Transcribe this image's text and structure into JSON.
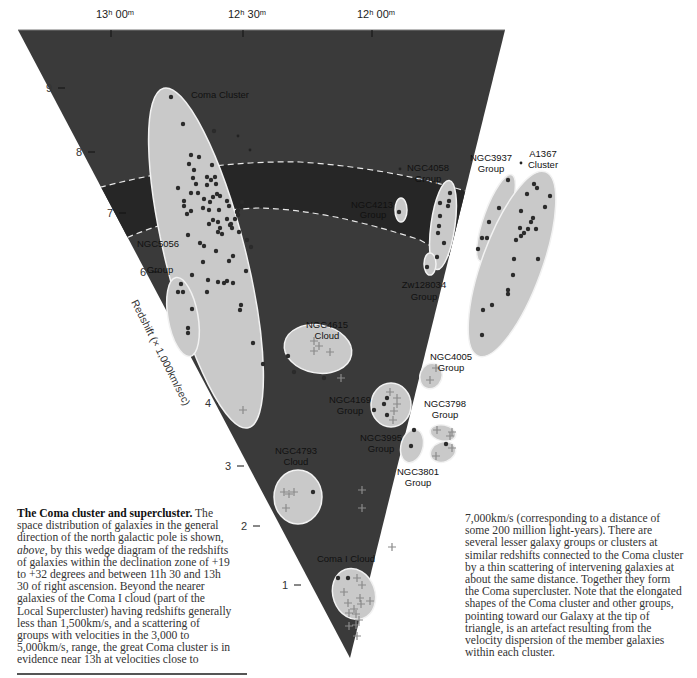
{
  "axes": {
    "top_ticks": [
      {
        "label": "13ʰ 00ᵐ",
        "x": 112
      },
      {
        "label": "12ʰ 30ᵐ",
        "x": 243
      },
      {
        "label": "12ʰ 00ᵐ",
        "x": 373
      }
    ],
    "redshift_ticks": [
      "1",
      "2",
      "3",
      "4",
      "5",
      "6",
      "7",
      "8",
      "9"
    ],
    "redshift_title": "Redshift (× 1,000km/sec)"
  },
  "groups": {
    "coma_cluster": "Coma Cluster",
    "ngc5056": [
      "NGC5056",
      "Group"
    ],
    "ngc4213": [
      "NGC4213",
      "Group"
    ],
    "ngc4058": [
      "NGC4058",
      "Group"
    ],
    "ngc3937": [
      "NGC3937",
      "Group"
    ],
    "a1367": [
      "A1367",
      "Cluster"
    ],
    "zw128034": [
      "Zw128034",
      "Group"
    ],
    "ngc4615": [
      "NGC4615",
      "Cloud"
    ],
    "ngc4005": [
      "NGC4005",
      "Group"
    ],
    "ngc4169": [
      "NGC4169",
      "Group"
    ],
    "ngc3798": [
      "NGC3798",
      "Group"
    ],
    "ngc3995": [
      "NGC3995",
      "Group"
    ],
    "ngc3801": [
      "NGC3801",
      "Group"
    ],
    "ngc4793": [
      "NGC4793",
      "Cloud"
    ],
    "coma_i_cloud": "Coma I Cloud"
  },
  "colors": {
    "wedge": "#3a3a3a",
    "band": "#262626",
    "ellipse_fill": "#c9c9c9",
    "ellipse_stroke": "#f2f2f2",
    "dot": "#2b2b2b",
    "cross": "#8a8a8a",
    "dash": "#e8e8e8"
  },
  "caption": {
    "left_title": "The Coma cluster and supercluster.",
    "left_text_1": " The space distribution of galaxies in the general direction of the north galactic pole is shown, ",
    "left_italic": "above",
    "left_text_2": ", by this wedge diagram of the redshifts of galaxies within the declination zone of +19 to +32 degrees and between 11h 30 and 13h 30 of right ascension. Beyond the nearer galaxies of the Coma I cloud (part of the Local Supercluster) having redshifts generally less than 1,500km/s, and a scattering of groups with velocities in the 3,000 to 5,000km/s, range, the great Coma cluster is in evidence near 13h at velocities close to",
    "right_text": "7,000km/s (corresponding to a distance of some 200 million light-years). There are several lesser galaxy groups or clusters at similar redshifts connected to the Coma cluster by a thin scattering of intervening galaxies at about the same distance. Together they form the Coma supercluster. Note that the elongated shapes of the Coma cluster and other groups, pointing toward our Galaxy at the tip of triangle, is an artefact resulting from the velocity dispersion of the member galaxies within each cluster."
  }
}
